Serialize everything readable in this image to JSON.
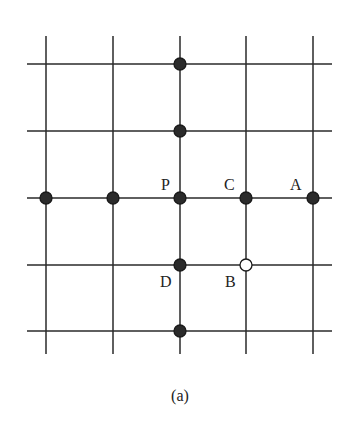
{
  "figure": {
    "caption": "(a)",
    "grid": {
      "vertical_lines_x": [
        46,
        113,
        180,
        246,
        313
      ],
      "vertical_y_range": [
        36,
        354
      ],
      "horizontal_lines_y": [
        64,
        131,
        198,
        265,
        331
      ],
      "horizontal_x_range": [
        27,
        332
      ],
      "line_color": "#2a2a2a"
    },
    "points": [
      {
        "x": 180,
        "y": 64,
        "filled": true,
        "label": ""
      },
      {
        "x": 180,
        "y": 131,
        "filled": true,
        "label": ""
      },
      {
        "x": 46,
        "y": 198,
        "filled": true,
        "label": ""
      },
      {
        "x": 113,
        "y": 198,
        "filled": true,
        "label": ""
      },
      {
        "x": 180,
        "y": 198,
        "filled": true,
        "label": "P"
      },
      {
        "x": 246,
        "y": 198,
        "filled": true,
        "label": "C"
      },
      {
        "x": 313,
        "y": 198,
        "filled": true,
        "label": "A"
      },
      {
        "x": 180,
        "y": 265,
        "filled": true,
        "label": "D"
      },
      {
        "x": 246,
        "y": 265,
        "filled": false,
        "label": "B"
      },
      {
        "x": 180,
        "y": 331,
        "filled": true,
        "label": ""
      }
    ],
    "labels": [
      {
        "text": "P",
        "x": 161,
        "y": 190
      },
      {
        "text": "C",
        "x": 224,
        "y": 190
      },
      {
        "text": "A",
        "x": 290,
        "y": 190
      },
      {
        "text": "D",
        "x": 160,
        "y": 287
      },
      {
        "text": "B",
        "x": 225,
        "y": 287
      }
    ]
  }
}
